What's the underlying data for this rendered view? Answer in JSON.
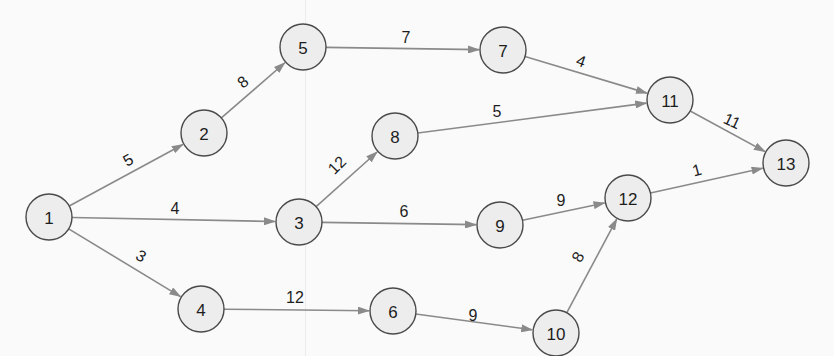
{
  "diagram": {
    "type": "activity-network",
    "style": {
      "node_fill": "#ededed",
      "node_stroke": "#4a4a4a",
      "edge_color": "#8a8a8a",
      "text_color": "#1e1e1e",
      "background": "#fafafa",
      "node_radius": 23
    },
    "nodes": [
      {
        "id": "1",
        "label": "1",
        "x": 49,
        "y": 217
      },
      {
        "id": "2",
        "label": "2",
        "x": 204,
        "y": 133
      },
      {
        "id": "3",
        "label": "3",
        "x": 299,
        "y": 222
      },
      {
        "id": "4",
        "label": "4",
        "x": 201,
        "y": 309
      },
      {
        "id": "5",
        "label": "5",
        "x": 303,
        "y": 47
      },
      {
        "id": "6",
        "label": "6",
        "x": 393,
        "y": 311
      },
      {
        "id": "7",
        "label": "7",
        "x": 503,
        "y": 50
      },
      {
        "id": "8",
        "label": "8",
        "x": 395,
        "y": 136
      },
      {
        "id": "9",
        "label": "9",
        "x": 500,
        "y": 225
      },
      {
        "id": "10",
        "label": "10",
        "x": 556,
        "y": 333
      },
      {
        "id": "11",
        "label": "11",
        "x": 670,
        "y": 100
      },
      {
        "id": "12",
        "label": "12",
        "x": 628,
        "y": 198
      },
      {
        "id": "13",
        "label": "13",
        "x": 786,
        "y": 163
      }
    ],
    "edges": [
      {
        "from": "1",
        "to": "2",
        "weight": "5",
        "lx": 128,
        "ly": 160,
        "rot": -30
      },
      {
        "from": "1",
        "to": "3",
        "weight": "4",
        "lx": 175,
        "ly": 208,
        "rot": 0
      },
      {
        "from": "1",
        "to": "4",
        "weight": "3",
        "lx": 141,
        "ly": 256,
        "rot": 30
      },
      {
        "from": "2",
        "to": "5",
        "weight": "8",
        "lx": 243,
        "ly": 82,
        "rot": -40
      },
      {
        "from": "3",
        "to": "8",
        "weight": "12",
        "lx": 337,
        "ly": 165,
        "rot": -45
      },
      {
        "from": "3",
        "to": "9",
        "weight": "6",
        "lx": 404,
        "ly": 211,
        "rot": 0
      },
      {
        "from": "4",
        "to": "6",
        "weight": "12",
        "lx": 295,
        "ly": 297,
        "rot": 0
      },
      {
        "from": "5",
        "to": "7",
        "weight": "7",
        "lx": 406,
        "ly": 37,
        "rot": 0
      },
      {
        "from": "6",
        "to": "10",
        "weight": "9",
        "lx": 473,
        "ly": 315,
        "rot": 0
      },
      {
        "from": "7",
        "to": "11",
        "weight": "4",
        "lx": 581,
        "ly": 61,
        "rot": 20
      },
      {
        "from": "8",
        "to": "11",
        "weight": "5",
        "lx": 497,
        "ly": 111,
        "rot": 0
      },
      {
        "from": "9",
        "to": "12",
        "weight": "9",
        "lx": 561,
        "ly": 200,
        "rot": 0
      },
      {
        "from": "10",
        "to": "12",
        "weight": "8",
        "lx": 578,
        "ly": 257,
        "rot": -60
      },
      {
        "from": "11",
        "to": "13",
        "weight": "11",
        "lx": 732,
        "ly": 121,
        "rot": 25
      },
      {
        "from": "12",
        "to": "13",
        "weight": "1",
        "lx": 697,
        "ly": 170,
        "rot": -15
      }
    ]
  }
}
